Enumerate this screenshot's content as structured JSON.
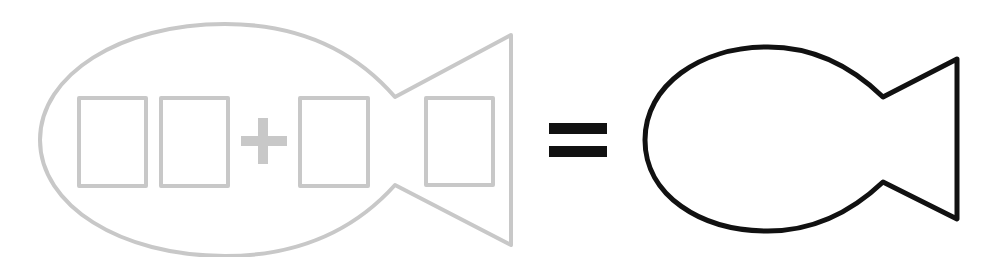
{
  "diagram": {
    "colors": {
      "left_fish_stroke": "#c8c8c8",
      "right_fish_stroke": "#111111",
      "equals_fill": "#111111",
      "background": "#ffffff"
    },
    "left_fish": {
      "boxes": [
        {
          "id": "tens-digit-box",
          "value": ""
        },
        {
          "id": "ones-digit-box",
          "value": ""
        },
        {
          "id": "addend-digit-box",
          "value": ""
        },
        {
          "id": "tail-box",
          "value": ""
        }
      ],
      "operator": "+"
    },
    "equals": "=",
    "right_fish": {
      "answer": ""
    }
  }
}
